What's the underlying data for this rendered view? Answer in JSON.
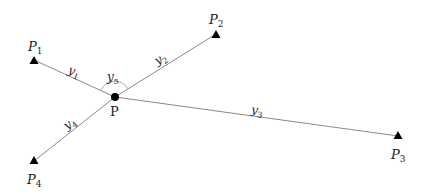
{
  "diagram": {
    "center": {
      "label": "P",
      "x": 115,
      "y": 97
    },
    "points": [
      {
        "id": "P1",
        "label": "P",
        "sub": "1",
        "x": 34,
        "y": 60,
        "lx": 34,
        "ly": 49
      },
      {
        "id": "P2",
        "label": "P",
        "sub": "2",
        "x": 216,
        "y": 34,
        "lx": 216,
        "ly": 22
      },
      {
        "id": "P3",
        "label": "P",
        "sub": "3",
        "x": 398,
        "y": 136,
        "lx": 398,
        "ly": 157
      },
      {
        "id": "P4",
        "label": "P",
        "sub": "4",
        "x": 34,
        "y": 161,
        "lx": 34,
        "ly": 181
      }
    ],
    "edges": [
      {
        "label": "y",
        "sub": "1",
        "lx": 73,
        "ly": 72
      },
      {
        "label": "y",
        "sub": "2",
        "lx": 160,
        "ly": 60
      },
      {
        "label": "y",
        "sub": "3",
        "lx": 256,
        "ly": 111
      },
      {
        "label": "y",
        "sub": "4",
        "lx": 70,
        "ly": 124
      }
    ],
    "angle": {
      "label": "y",
      "sub": "5",
      "lx": 112,
      "ly": 79
    },
    "colors": {
      "line": "#8a8a8a",
      "marker": "#000000",
      "arc": "#9a9a9a"
    }
  }
}
